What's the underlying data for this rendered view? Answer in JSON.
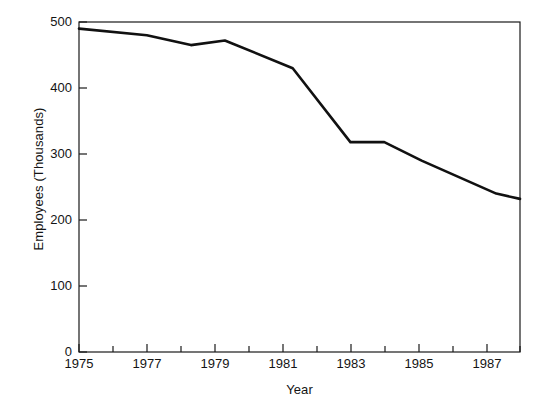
{
  "chart_data": {
    "type": "line",
    "title": "",
    "xlabel": "Year",
    "ylabel": "Employees (Thousands)",
    "xlim": [
      1975,
      1988
    ],
    "ylim": [
      0,
      500
    ],
    "grid": false,
    "legend": null,
    "x_ticks_major": [
      1975,
      1977,
      1979,
      1981,
      1983,
      1985,
      1987
    ],
    "x_tick_labels": [
      "1975",
      "1977",
      "1979",
      "1981",
      "1983",
      "1985",
      "1987"
    ],
    "x_ticks_minor": [
      1976,
      1978,
      1980,
      1982,
      1984,
      1986,
      1988
    ],
    "y_ticks": [
      0,
      100,
      200,
      300,
      400,
      500
    ],
    "y_tick_labels": [
      "0",
      "100",
      "200",
      "300",
      "400",
      "500"
    ],
    "series": [
      {
        "name": "Employees",
        "color": "#111111",
        "x": [
          1975,
          1977,
          1978.3,
          1979.3,
          1981.3,
          1983,
          1984,
          1985.1,
          1987.3,
          1988
        ],
        "values": [
          490,
          480,
          465,
          472,
          430,
          318,
          318,
          290,
          240,
          232
        ]
      }
    ]
  }
}
